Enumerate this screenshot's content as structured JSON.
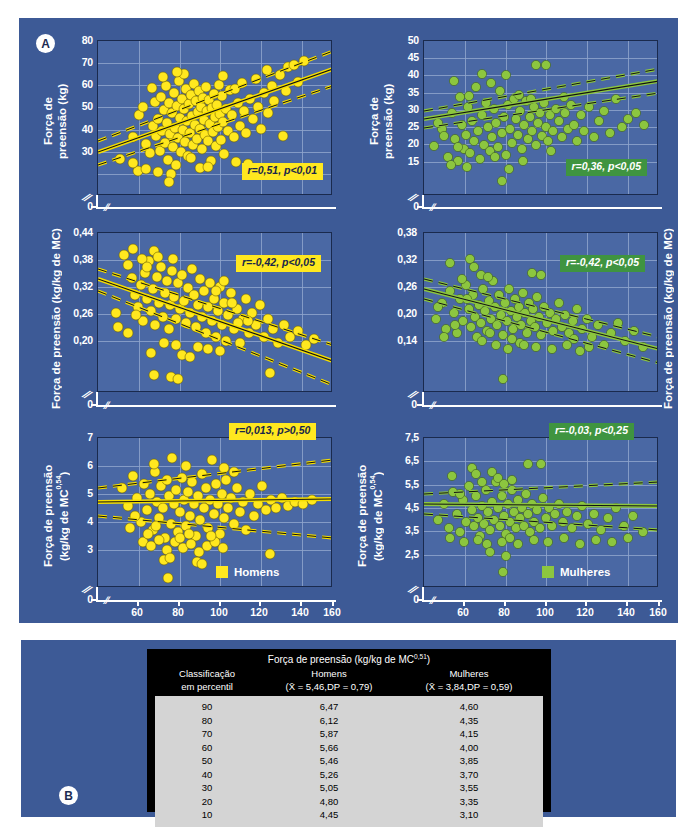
{
  "figure": {
    "panel_a_tag": "A",
    "panel_b_tag": "B",
    "background_color": "#3d5a96",
    "plot_background_color": "#4a68a4",
    "men_color": "#ffe81f",
    "women_color": "#8cc63f",
    "x_axis_label": "Massa corporal (kg)",
    "x_ticks": [
      "60",
      "80",
      "100",
      "120",
      "140",
      "160"
    ]
  },
  "chart_data": [
    {
      "id": "men-absolute",
      "type": "scatter",
      "title": "",
      "group": "Homens",
      "color": "#ffe81f",
      "xlabel": "Massa corporal (kg)",
      "ylabel": "Força de preensão (kg)",
      "ylabel_lines": [
        "Força de",
        "preensão (kg)"
      ],
      "xlim": [
        45,
        160
      ],
      "ylim": [
        25,
        80
      ],
      "x_ticks": [
        "60",
        "80",
        "100",
        "120",
        "140",
        "160"
      ],
      "y_ticks": [
        "80",
        "70",
        "60",
        "50",
        "40",
        "30",
        "0"
      ],
      "grid": true,
      "annotation": "r=0,51, p<0,01",
      "r": 0.51,
      "p_text": "p<0,01",
      "regression": {
        "slope": 0.345,
        "intercept": 20.0
      },
      "ci_offset": 4.2,
      "n": 150
    },
    {
      "id": "women-absolute",
      "type": "scatter",
      "group": "Mulheres",
      "color": "#8cc63f",
      "xlabel": "Massa corporal (kg)",
      "ylabel": "Força de preensão (kg)",
      "ylabel_lines": [
        "Força de",
        "preensão (kg)"
      ],
      "xlim": [
        45,
        160
      ],
      "ylim": [
        0,
        50
      ],
      "x_ticks": [
        "60",
        "80",
        "100",
        "120",
        "140",
        "160"
      ],
      "y_ticks": [
        "50",
        "45",
        "40",
        "35",
        "30",
        "25",
        "20",
        "15",
        "0"
      ],
      "grid": true,
      "annotation": "r=0,36, p<0,05",
      "r": 0.36,
      "p_text": "p<0,05",
      "regression": {
        "slope": 0.115,
        "intercept": 20.2
      },
      "ci_offset": 2.0,
      "n": 150
    },
    {
      "id": "men-ratio",
      "type": "scatter",
      "group": "Homens",
      "color": "#ffe81f",
      "xlabel": "Massa corporal (kg)",
      "ylabel": "Força de preensão (kg/kg de MC)",
      "ylabel_lines": [
        "Força de preensão (kg/kg de MC)"
      ],
      "xlim": [
        45,
        160
      ],
      "ylim": [
        0.16,
        0.44
      ],
      "x_ticks": [
        "60",
        "80",
        "100",
        "120",
        "140",
        "160"
      ],
      "y_ticks": [
        "0,44",
        "0,38",
        "0,32",
        "0,26",
        "0,20",
        "0"
      ],
      "grid": true,
      "annotation": "r=-0,42, p<0,05",
      "r": -0.42,
      "p_text": "p<0,05",
      "regression": {
        "slope": -0.00145,
        "intercept": 0.413
      },
      "ci_offset": 0.016,
      "n": 150
    },
    {
      "id": "women-ratio",
      "type": "scatter",
      "group": "Mulheres",
      "color": "#8cc63f",
      "xlabel": "Massa corporal (kg)",
      "ylabel": "Força de preensão (kg/kg de MC)",
      "ylabel_lines": [
        "Força de preensão (kg/kg de MC)"
      ],
      "xlim": [
        45,
        160
      ],
      "ylim": [
        0.1,
        0.38
      ],
      "x_ticks": [
        "60",
        "80",
        "100",
        "120",
        "140",
        "160"
      ],
      "y_ticks": [
        "0,38",
        "0,32",
        "0,26",
        "0,20",
        "0,14",
        "0"
      ],
      "grid": true,
      "annotation": "r=-0,42, p<0,05",
      "r": -0.42,
      "p_text": "p<0,05",
      "regression": {
        "slope": -0.00082,
        "intercept": 0.3105
      },
      "ci_offset": 0.013,
      "n": 150
    },
    {
      "id": "men-allometric",
      "type": "scatter",
      "group": "Homens",
      "color": "#ffe81f",
      "xlabel": "Massa corporal (kg)",
      "ylabel": "Força de preensão (kg/kg de MC^0,54)",
      "ylabel_lines": [
        "Força de preensão",
        "(kg/kg de MC0,54)"
      ],
      "xlim": [
        45,
        160
      ],
      "ylim": [
        2.5,
        7
      ],
      "x_ticks": [
        "60",
        "80",
        "100",
        "120",
        "140",
        "160"
      ],
      "y_ticks": [
        "7",
        "6",
        "5",
        "4",
        "3",
        "0"
      ],
      "grid": true,
      "annotation": "r=0,013, p>0,50",
      "r": 0.013,
      "p_text": "p>0,50",
      "regression": {
        "slope": 0.0012,
        "intercept": 4.52
      },
      "ci_offset": 0.33,
      "legend_label": "Homens",
      "n": 150
    },
    {
      "id": "women-allometric",
      "type": "scatter",
      "group": "Mulheres",
      "color": "#8cc63f",
      "xlabel": "Massa corporal (kg)",
      "ylabel": "Força de preensão (kg/kg de MC^0,54)",
      "ylabel_lines": [
        "Força de preensão",
        "(kg/kg de MC0,54)"
      ],
      "xlim": [
        45,
        160
      ],
      "ylim": [
        2.0,
        7.5
      ],
      "x_ticks": [
        "60",
        "80",
        "100",
        "120",
        "140",
        "160"
      ],
      "y_ticks": [
        "7,5",
        "6,5",
        "5,5",
        "4,5",
        "3,5",
        "2,5",
        "0"
      ],
      "grid": true,
      "annotation": "r=-0,03, p<0,25",
      "r": -0.03,
      "p_text": "p<0,25",
      "regression": {
        "slope": -0.0004,
        "intercept": 4.28
      },
      "ci_offset": 0.28,
      "legend_label": "Mulheres",
      "n": 150
    }
  ],
  "table": {
    "title_prefix": "Força de preensão (kg/kg de MC",
    "title_sup": "0,51",
    "title_suffix": ")",
    "col1_line1": "Classificação",
    "col1_line2": "em percentil",
    "col2_line1": "Homens",
    "col2_line2": "(X̄ = 5,46,DP = 0,79)",
    "col3_line1": "Mulheres",
    "col3_line2": "(X̄ = 3,84,DP = 0,59)",
    "rows": [
      {
        "percentil": "90",
        "homens": "6,47",
        "mulheres": "4,60"
      },
      {
        "percentil": "80",
        "homens": "6,12",
        "mulheres": "4,35"
      },
      {
        "percentil": "70",
        "homens": "5,87",
        "mulheres": "4,15"
      },
      {
        "percentil": "60",
        "homens": "5,66",
        "mulheres": "4,00"
      },
      {
        "percentil": "50",
        "homens": "5,46",
        "mulheres": "3,85"
      },
      {
        "percentil": "40",
        "homens": "5,26",
        "mulheres": "3,70"
      },
      {
        "percentil": "30",
        "homens": "5,05",
        "mulheres": "3,55"
      },
      {
        "percentil": "20",
        "homens": "4,80",
        "mulheres": "3,35"
      },
      {
        "percentil": "10",
        "homens": "4,45",
        "mulheres": "3,10"
      }
    ]
  }
}
